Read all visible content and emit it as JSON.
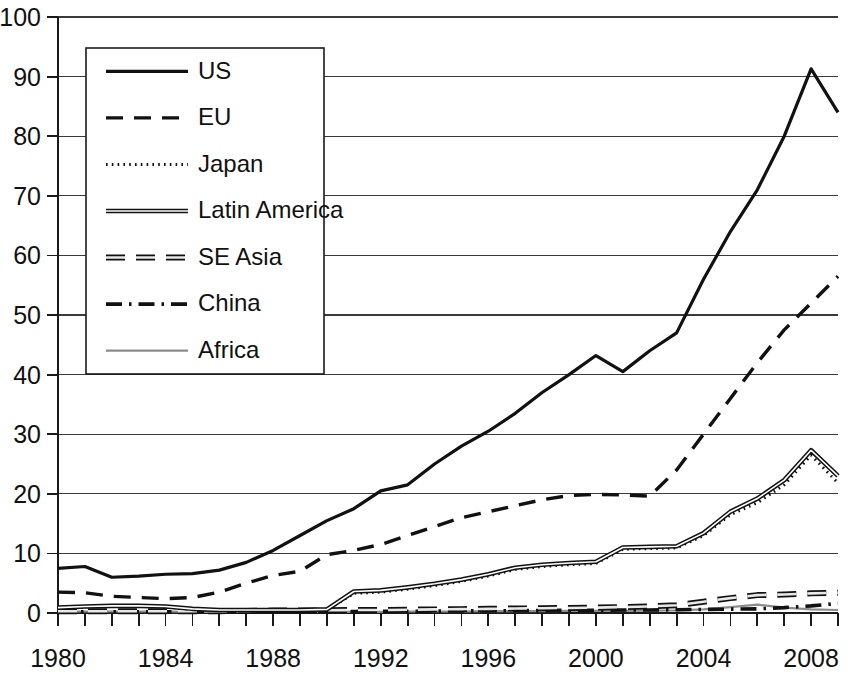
{
  "chart_data": {
    "type": "line",
    "title": "",
    "subtitle": "",
    "xlabel": "",
    "ylabel": "",
    "xlim": [
      1980,
      2009
    ],
    "ylim": [
      0,
      100
    ],
    "ytick_step": 10,
    "yticks": [
      0,
      10,
      20,
      30,
      40,
      50,
      60,
      70,
      80,
      90,
      100
    ],
    "ytick_labels": [
      "0",
      "10",
      "20",
      "30",
      "40",
      "50",
      "60",
      "70",
      "80",
      "90",
      "100"
    ],
    "xticks": [
      1980,
      1981,
      1982,
      1983,
      1984,
      1985,
      1986,
      1987,
      1988,
      1989,
      1990,
      1991,
      1992,
      1993,
      1994,
      1995,
      1996,
      1997,
      1998,
      1999,
      2000,
      2001,
      2002,
      2003,
      2004,
      2005,
      2006,
      2007,
      2008,
      2009
    ],
    "xtick_labels_shown": [
      "1980",
      "1984",
      "1988",
      "1992",
      "1996",
      "2000",
      "2004",
      "2008"
    ],
    "xtick_label_values": [
      1980,
      1984,
      1988,
      1992,
      1996,
      2000,
      2004,
      2008
    ],
    "x": [
      1980,
      1981,
      1982,
      1983,
      1984,
      1985,
      1986,
      1987,
      1988,
      1989,
      1990,
      1991,
      1992,
      1993,
      1994,
      1995,
      1996,
      1997,
      1998,
      1999,
      2000,
      2001,
      2002,
      2003,
      2004,
      2005,
      2006,
      2007,
      2008,
      2009
    ],
    "grid": "horizontal",
    "legend_position": "top-left-inside",
    "series": [
      {
        "name": "US",
        "style": "solid",
        "color": "#111111",
        "values": [
          7.5,
          7.8,
          6.0,
          6.2,
          6.5,
          6.6,
          7.2,
          8.5,
          10.5,
          13.0,
          15.5,
          17.5,
          20.5,
          21.5,
          25.0,
          28.0,
          30.5,
          33.5,
          37.0,
          40.0,
          43.2,
          40.5,
          44.0,
          47.0,
          56.0,
          64.0,
          71.0,
          80.0,
          91.3,
          84.0
        ]
      },
      {
        "name": "EU",
        "style": "dashed",
        "color": "#111111",
        "values": [
          3.5,
          3.4,
          2.8,
          2.6,
          2.4,
          2.6,
          3.5,
          5.0,
          6.3,
          7.0,
          9.8,
          10.5,
          11.5,
          13.0,
          14.5,
          16.0,
          17.0,
          18.0,
          19.0,
          19.7,
          19.9,
          19.8,
          19.6,
          24.0,
          30.0,
          36.0,
          42.0,
          47.5,
          52.0,
          56.5
        ]
      },
      {
        "name": "Japan",
        "style": "dotted",
        "color": "#111111",
        "values": [
          0.8,
          1.0,
          1.1,
          1.1,
          1.0,
          0.6,
          0.4,
          0.4,
          0.4,
          0.4,
          0.5,
          3.3,
          3.5,
          4.0,
          4.6,
          5.3,
          6.2,
          7.3,
          7.8,
          8.1,
          8.3,
          10.7,
          10.8,
          10.9,
          13.0,
          16.5,
          18.5,
          21.5,
          26.5,
          21.8
        ]
      },
      {
        "name": "Latin America",
        "style": "double-solid",
        "color": "#111111",
        "values": [
          0.9,
          1.1,
          1.2,
          1.2,
          1.1,
          0.7,
          0.5,
          0.5,
          0.5,
          0.5,
          0.6,
          3.6,
          3.8,
          4.3,
          4.9,
          5.6,
          6.5,
          7.6,
          8.1,
          8.4,
          8.6,
          11.0,
          11.1,
          11.2,
          13.4,
          17.0,
          19.2,
          22.3,
          27.3,
          23.0
        ]
      },
      {
        "name": "SE Asia",
        "style": "thick-dashed",
        "color": "#111111",
        "values": [
          0.3,
          0.3,
          0.3,
          0.3,
          0.3,
          0.3,
          0.3,
          0.35,
          0.4,
          0.4,
          0.45,
          0.5,
          0.5,
          0.55,
          0.6,
          0.65,
          0.7,
          0.75,
          0.8,
          0.85,
          0.9,
          1.0,
          1.1,
          1.3,
          1.9,
          2.5,
          3.0,
          3.1,
          3.3,
          3.4
        ]
      },
      {
        "name": "China",
        "style": "dash-dot",
        "color": "#111111",
        "values": [
          0.2,
          0.2,
          0.2,
          0.2,
          0.2,
          0.2,
          0.2,
          0.2,
          0.2,
          0.2,
          0.25,
          0.25,
          0.3,
          0.3,
          0.3,
          0.35,
          0.35,
          0.4,
          0.4,
          0.45,
          0.45,
          0.5,
          0.5,
          0.55,
          0.6,
          0.65,
          0.7,
          0.9,
          1.2,
          1.6
        ]
      },
      {
        "name": "Africa",
        "style": "thin-gray-solid",
        "color": "#8c8c8c",
        "values": [
          0.25,
          0.25,
          0.25,
          0.25,
          0.25,
          0.2,
          0.2,
          0.2,
          0.2,
          0.2,
          0.2,
          0.2,
          0.2,
          0.25,
          0.25,
          0.25,
          0.3,
          0.3,
          0.3,
          0.35,
          0.35,
          0.35,
          0.4,
          0.45,
          0.6,
          1.0,
          1.4,
          0.9,
          0.6,
          0.5
        ]
      }
    ],
    "legend_entries": [
      {
        "label": "US",
        "style": "solid"
      },
      {
        "label": "EU",
        "style": "dashed"
      },
      {
        "label": "Japan",
        "style": "dotted"
      },
      {
        "label": "Latin America",
        "style": "double-solid"
      },
      {
        "label": "SE Asia",
        "style": "thick-dashed"
      },
      {
        "label": "China",
        "style": "dash-dot"
      },
      {
        "label": "Africa",
        "style": "thin-gray-solid"
      }
    ]
  }
}
